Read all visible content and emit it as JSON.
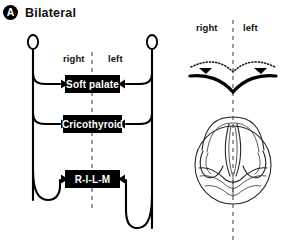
{
  "figure": {
    "panel_letter": "A",
    "panel_title": "Bilateral"
  },
  "left_diagram": {
    "side_labels": {
      "right": "right",
      "left": "left"
    },
    "branches": [
      {
        "label": "Soft palate"
      },
      {
        "label": "Cricothyroid"
      },
      {
        "label": "R-I-L-M"
      }
    ]
  },
  "right_diagram": {
    "side_labels": {
      "right": "right",
      "left": "left"
    },
    "palate_view_name": "soft-palate-drooping-view",
    "larynx_view_name": "laryngoscopic-glottis-view"
  },
  "colors": {
    "ink": "#000000",
    "box_fill": "#000000",
    "box_text": "#ffffff",
    "midline": "#5a5a5a",
    "page": "#ffffff"
  }
}
